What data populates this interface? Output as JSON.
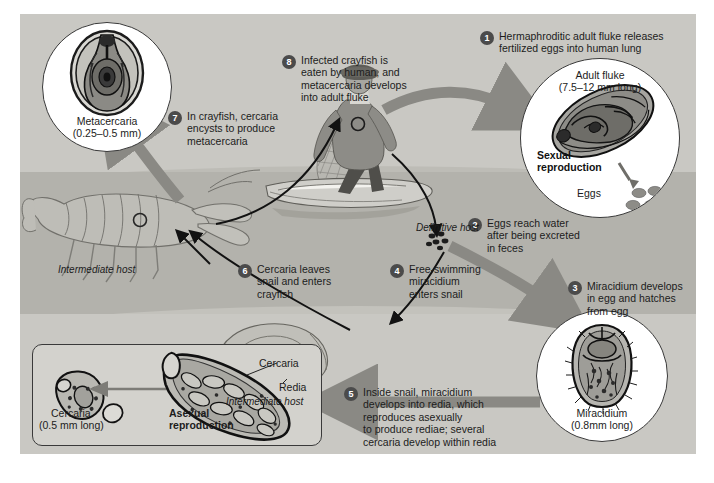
{
  "diagram": {
    "colors": {
      "sky": "#c9c8c3",
      "water": "#b3b2ac",
      "bullet": "#4b4b4b",
      "arrow_gray": "#8a8984",
      "arrow_black": "#121212",
      "panel_border": "#3a3a3a"
    }
  },
  "steps": [
    {
      "number": "1",
      "text": "Hermaphroditic adult fluke releases\nfertilized eggs into human lung"
    },
    {
      "number": "2",
      "text": "Eggs reach water\nafter being excreted\nin feces"
    },
    {
      "number": "3",
      "text": "Miracidium develops\nin egg and hatches\nfrom egg"
    },
    {
      "number": "4",
      "text": "Free-swimming\nmiracidium\nenters snail"
    },
    {
      "number": "5",
      "text": "Inside snail, miracidium\ndevelops into redia, which\nreproduces asexually\nto produce rediae; several\ncercaria develop within redia"
    },
    {
      "number": "6",
      "text": "Cercaria leaves\nsnail and enters\ncrayfish"
    },
    {
      "number": "7",
      "text": "In crayfish, cercaria\nencysts to produce\nmetacercaria"
    },
    {
      "number": "8",
      "text": "Infected crayfish is\neaten by human, and\nmetacercaria develops\ninto adult fluke"
    }
  ],
  "insets": {
    "metacercaria": {
      "name": "Metacercaria",
      "size": "(0.25–0.5 mm)"
    },
    "adult_fluke": {
      "name": "Adult fluke",
      "size": "(7.5–12 mm long)",
      "reproduction_label": "Sexual\nreproduction",
      "eggs_label": "Eggs"
    },
    "miracidium": {
      "name": "Miracidium",
      "size": "(0.8mm long)"
    },
    "asexual_box": {
      "cercaria_name": "Cercaria",
      "cercaria_size": "(0.5 mm long)",
      "reproduction_label": "Asexual\nreproduction",
      "callout_cercaria": "Cercaria",
      "callout_redia": "Redia"
    }
  },
  "host_labels": {
    "definitive": "Definitive host",
    "intermediate_crayfish": "Intermediate host",
    "intermediate_snail": "Intermediate host"
  }
}
